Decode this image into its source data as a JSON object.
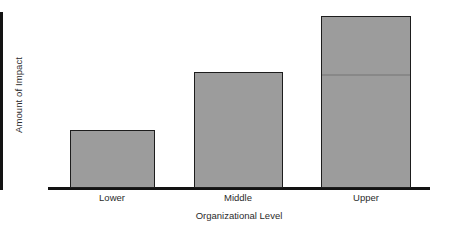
{
  "chart_data": {
    "type": "bar",
    "title": "",
    "xlabel": "Organizational Level",
    "ylabel": "Amount of Impact",
    "categories": [
      "Lower",
      "Middle",
      "Upper"
    ],
    "values": [
      33,
      66,
      98
    ],
    "ylim": [
      0,
      100
    ],
    "grid": false,
    "legend": false,
    "axis_tick_labels_y": [],
    "annotations": [],
    "bar_fill_color": "#9c9c9c",
    "bar_border_color": "#1d1d1d",
    "axis_color": "#131313",
    "background_color": "#ffffff"
  },
  "figure": {
    "y_axis_title": "Amount of Impact",
    "x_axis_title": "Organizational Level"
  }
}
